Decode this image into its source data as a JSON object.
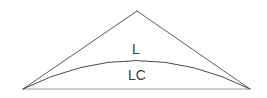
{
  "figure": {
    "background_color": "#ffffff",
    "width": 267,
    "height": 98,
    "labels": {
      "arc_label": "L",
      "chord_label": "LC"
    },
    "colors": {
      "triangle_stroke": "#5a5a5a",
      "arc_stroke": "#4a4a4a",
      "base_stroke": "#9a9a9a",
      "text": "#3a3a3a"
    },
    "geometry": {
      "left_vertex": "23,89",
      "right_vertex": "250,89",
      "apex": "137,11",
      "arc_peak_y": 60,
      "base_y": 89
    },
    "label_positions": {
      "arc_label_x": 136,
      "arc_label_y": 50,
      "chord_label_x": 137,
      "chord_label_y": 76
    },
    "font_sizes": {
      "arc_label": 14,
      "chord_label": 14
    }
  }
}
